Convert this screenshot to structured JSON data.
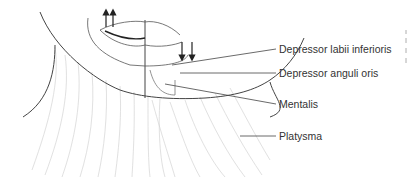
{
  "figure": {
    "labels": [
      {
        "id": "depressor-labii-inferioris",
        "text": "Depressor labii inferioris",
        "x": 279,
        "y": 43
      },
      {
        "id": "depressor-anguli-oris",
        "text": "Depressor anguli oris",
        "x": 279,
        "y": 67
      },
      {
        "id": "mentalis",
        "text": "Mentalis",
        "x": 279,
        "y": 98
      },
      {
        "id": "platysma",
        "text": "Platysma",
        "x": 279,
        "y": 130
      }
    ],
    "arrows": {
      "up": [
        "elevation arrow",
        "elevation arrow"
      ],
      "down": [
        "depression arrow",
        "depression arrow"
      ]
    },
    "colors": {
      "line": "#444444",
      "shading": "#bbbbbb",
      "text": "#333333"
    }
  }
}
